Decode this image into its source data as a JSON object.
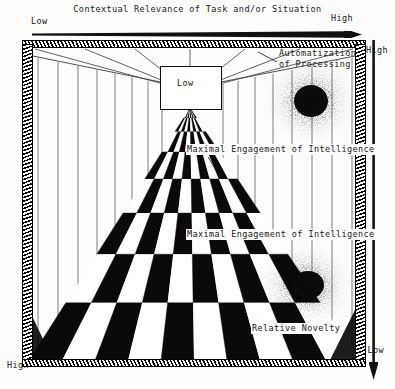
{
  "figure": {
    "type": "conceptual-perspective-diagram"
  },
  "top_axis": {
    "title": "Contextual Relevance of Task and/or Situation",
    "low_label": "Low",
    "high_label": "High",
    "arrow_direction": "right"
  },
  "right_axis": {
    "title": "Level of Experience with Task and/or Situation",
    "high_label": "High",
    "low_label": "Low",
    "arrow_direction": "down"
  },
  "left_axis": {
    "high_label": "High"
  },
  "scene": {
    "vanishing_point_label": "Low",
    "labels": {
      "automatization_line1": "Automatization",
      "automatization_line2": "of Processing",
      "maximal_engagement_upper": "Maximal Engagement of Intelligence",
      "maximal_engagement_lower": "Maximal Engagement of Intelligence",
      "relative_novelty": "Relative Novelty"
    }
  },
  "colors": {
    "ink": "#111111",
    "paper": "#fdfdfb",
    "checker_dark": "#0a0a0a",
    "checker_light": "#ffffff",
    "wall_line": "#6d6d6d"
  }
}
